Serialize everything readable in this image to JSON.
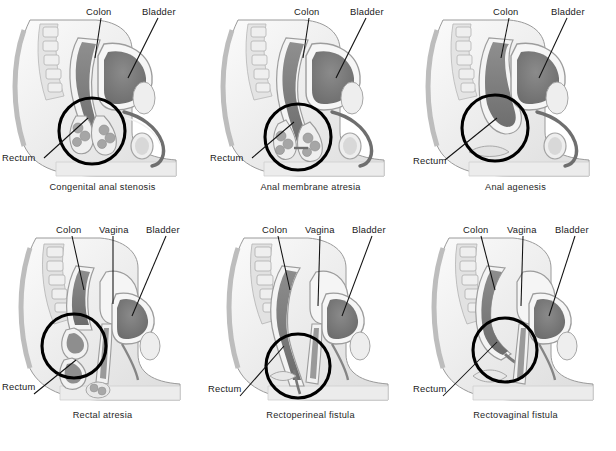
{
  "figure": {
    "rows": 2,
    "columns": 3,
    "background_color": "#ffffff",
    "line_color": "#111111",
    "highlight_circle_color": "#000000"
  },
  "panels": [
    {
      "id": "congenital-anal-stenosis",
      "caption": "Congenital anal stenosis",
      "sex": "male",
      "labels": [
        {
          "name": "colon",
          "text": "Colon"
        },
        {
          "name": "bladder",
          "text": "Bladder"
        },
        {
          "name": "rectum",
          "text": "Rectum"
        }
      ]
    },
    {
      "id": "anal-membrane-atresia",
      "caption": "Anal membrane atresia",
      "sex": "male",
      "labels": [
        {
          "name": "colon",
          "text": "Colon"
        },
        {
          "name": "bladder",
          "text": "Bladder"
        },
        {
          "name": "rectum",
          "text": "Rectum"
        }
      ]
    },
    {
      "id": "anal-agenesis",
      "caption": "Anal agenesis",
      "sex": "male",
      "labels": [
        {
          "name": "colon",
          "text": "Colon"
        },
        {
          "name": "bladder",
          "text": "Bladder"
        },
        {
          "name": "rectum",
          "text": "Rectum"
        }
      ]
    },
    {
      "id": "rectal-atresia",
      "caption": "Rectal atresia",
      "sex": "female",
      "labels": [
        {
          "name": "colon",
          "text": "Colon"
        },
        {
          "name": "vagina",
          "text": "Vagina"
        },
        {
          "name": "bladder",
          "text": "Bladder"
        },
        {
          "name": "rectum",
          "text": "Rectum"
        }
      ]
    },
    {
      "id": "rectoperineal-fistula",
      "caption": "Rectoperineal fistula",
      "sex": "female",
      "labels": [
        {
          "name": "colon",
          "text": "Colon"
        },
        {
          "name": "vagina",
          "text": "Vagina"
        },
        {
          "name": "bladder",
          "text": "Bladder"
        },
        {
          "name": "rectum",
          "text": "Rectum"
        }
      ]
    },
    {
      "id": "rectovaginal-fistula",
      "caption": "Rectovaginal fistula",
      "sex": "female",
      "labels": [
        {
          "name": "colon",
          "text": "Colon"
        },
        {
          "name": "vagina",
          "text": "Vagina"
        },
        {
          "name": "bladder",
          "text": "Bladder"
        },
        {
          "name": "rectum",
          "text": "Rectum"
        }
      ]
    }
  ],
  "palette": {
    "skin_light": "#f2f2f2",
    "skin_mid": "#dcdcdc",
    "tissue": "#c4c4c4",
    "organ_mid": "#a8a8a8",
    "organ_dark": "#7d7d7d",
    "organ_darkest": "#666666",
    "outline": "#8a8a8a",
    "bone": "#e6e6e6",
    "text": "#1a1a1a"
  }
}
